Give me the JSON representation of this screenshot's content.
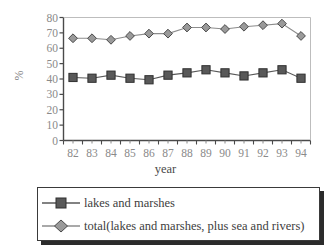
{
  "chart_data": {
    "type": "line",
    "title": "",
    "subtitle": "",
    "xlabel": "year",
    "ylabel": "%",
    "categories": [
      "82",
      "83",
      "84",
      "85",
      "86",
      "87",
      "88",
      "89",
      "90",
      "91",
      "92",
      "93",
      "94"
    ],
    "xlim": [
      0,
      13
    ],
    "ylim": [
      0,
      80
    ],
    "yticks": [
      0,
      10,
      20,
      30,
      40,
      50,
      60,
      70,
      80
    ],
    "ytick_labels": [
      "0",
      "10",
      "20",
      "30",
      "40",
      "50",
      "60",
      "70",
      "80"
    ],
    "grid": false,
    "legend_position": "below",
    "series": [
      {
        "name": "lakes and marshes",
        "marker": "square",
        "color": "#595959",
        "values": [
          41,
          40.5,
          42.5,
          40.5,
          39.5,
          42.5,
          44,
          46,
          44,
          42,
          44,
          46,
          40.5
        ]
      },
      {
        "name": "total(lakes and marshes, plus sea and rivers)",
        "marker": "diamond",
        "color": "#8c8c8c",
        "values": [
          66.5,
          66.5,
          65.5,
          68,
          69.5,
          69.5,
          73.5,
          73.5,
          72.5,
          74,
          75,
          76,
          68
        ]
      }
    ],
    "annotations": []
  },
  "axes": {
    "y_title": "%",
    "x_title": "year"
  },
  "legend": {
    "entries": [
      {
        "label": "lakes and marshes",
        "marker": "square-marker-icon"
      },
      {
        "label": "total(lakes and marshes, plus sea and rivers)",
        "marker": "diamond-marker-icon"
      }
    ]
  },
  "colors": {
    "axis": "#4a4a4a",
    "tick_text": "#8a8a8a",
    "series_square": "#595959",
    "series_diamond": "#8c8c8c",
    "legend_border": "#3a3a3a",
    "legend_shadow": "#2b2b2b",
    "background": "#ffffff"
  }
}
